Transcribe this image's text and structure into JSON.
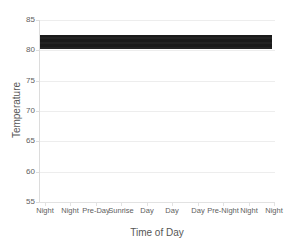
{
  "chart_data": {
    "type": "line",
    "title": "",
    "subtitle": "",
    "xlabel": "Time of Day",
    "ylabel": "Temperature",
    "categories": [
      "Night",
      "Night",
      "Pre-Day",
      "Sunrise",
      "Day",
      "Day",
      "Day",
      "Pre-Night",
      "Night",
      "Night"
    ],
    "x_tick_labels": [
      "Night",
      "Night",
      "Pre-Day",
      "Sunrise",
      "Day",
      "Day",
      "Day",
      "Pre-Night",
      "Night",
      "Night"
    ],
    "y_tick_labels": [
      "85",
      "80",
      "75",
      "70",
      "65",
      "60",
      "55"
    ],
    "y_ticks": [
      85,
      80,
      75,
      70,
      65,
      60,
      55
    ],
    "ylim": [
      55,
      85
    ],
    "xlim": [
      0,
      9
    ],
    "grid": "horizontal",
    "legend": "none",
    "series": [
      {
        "name": "Temperature",
        "color": "#1a1a1a",
        "values": [
          81.5,
          81.4,
          81.3,
          81.2,
          81.6,
          82.0,
          82.1,
          81.9,
          81.7,
          81.5
        ],
        "band_min": 80.2,
        "band_max": 82.6
      }
    ],
    "annotations": []
  },
  "axes": {
    "x_title": "Time of Day",
    "y_title": "Temperature"
  },
  "colors": {
    "series": "#1a1a1a",
    "grid": "#ededed",
    "axis": "#dcdcdc",
    "text": "#5e5e5e",
    "background": "#ffffff"
  }
}
